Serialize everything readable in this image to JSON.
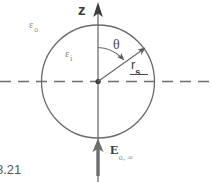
{
  "figure": {
    "caption": "8.21",
    "background_color": "#ffffff",
    "line_color": "#5a5a5a",
    "accent_color": "#3c3c3c",
    "faint_color": "#8d8d8d"
  },
  "axes": {
    "vertical": {
      "label": "z",
      "name": "z-axis",
      "direction": "up",
      "style": "solid-with-arrow"
    },
    "horizontal": {
      "label": "",
      "name": "equatorial-axis",
      "style": "dashed"
    }
  },
  "sphere": {
    "name": "dielectric-sphere",
    "center_label": "",
    "inner_permittivity": "ε",
    "inner_permittivity_subscript": "i",
    "outer_permittivity": "ε",
    "outer_permittivity_subscript": "o",
    "radius_label": "r",
    "radius_subscript": "s"
  },
  "angles": {
    "polar": {
      "name": "polar-angle",
      "label": "θ"
    }
  },
  "field": {
    "name": "applied-electric-field",
    "label": "E",
    "subscript": "o, ∞",
    "direction": "up"
  }
}
